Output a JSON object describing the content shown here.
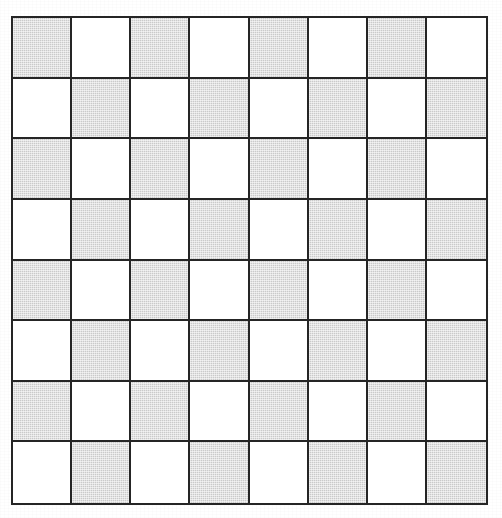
{
  "figure": {
    "name": "checkerboard",
    "rows": 8,
    "columns": 8
  },
  "colors": {
    "dark_square": "#cacaca",
    "light_square": "#ffffff",
    "grid_line": "#252525",
    "background": "#ffffff"
  },
  "chart_data": {
    "type": "heatmap",
    "title": "",
    "xlabel": "",
    "ylabel": "",
    "rows": 8,
    "columns": 8,
    "legend": [
      "light",
      "dark"
    ],
    "grid": true,
    "cells": [
      [
        "dark",
        "light",
        "dark",
        "light",
        "dark",
        "light",
        "dark",
        "light"
      ],
      [
        "light",
        "dark",
        "light",
        "dark",
        "light",
        "dark",
        "light",
        "dark"
      ],
      [
        "dark",
        "light",
        "dark",
        "light",
        "dark",
        "light",
        "dark",
        "light"
      ],
      [
        "light",
        "dark",
        "light",
        "dark",
        "light",
        "dark",
        "light",
        "dark"
      ],
      [
        "dark",
        "light",
        "dark",
        "light",
        "dark",
        "light",
        "dark",
        "light"
      ],
      [
        "light",
        "dark",
        "light",
        "dark",
        "light",
        "dark",
        "light",
        "dark"
      ],
      [
        "dark",
        "light",
        "dark",
        "light",
        "dark",
        "light",
        "dark",
        "light"
      ],
      [
        "light",
        "dark",
        "light",
        "dark",
        "light",
        "dark",
        "light",
        "dark"
      ]
    ]
  }
}
